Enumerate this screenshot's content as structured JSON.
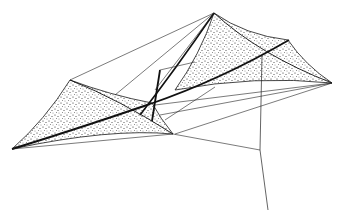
{
  "figure": {
    "background": "#ffffff",
    "ink": "#1a1a1a"
  }
}
